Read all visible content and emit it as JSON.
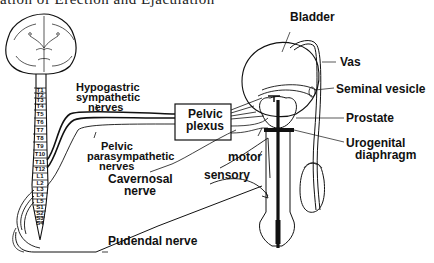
{
  "title": "ation of Erection and Ejaculation",
  "labels": {
    "bladder": "Bladder",
    "vas": "Vas",
    "seminal_vesicle": "Seminal vesicle",
    "prostate": "Prostate",
    "urogenital_1": "Urogenital",
    "urogenital_2": "diaphragm",
    "hypogastric_1": "Hypogastric",
    "hypogastric_2": "sympathetic",
    "hypogastric_3": "nerves",
    "pelvic_plexus_1": "Pelvic",
    "pelvic_plexus_2": "plexus",
    "pelvic_para_1": "Pelvic",
    "pelvic_para_2": "parasympathetic",
    "pelvic_para_3": "nerves",
    "cavernosal_1": "Cavernosal",
    "cavernosal_2": "nerve",
    "motor": "motor",
    "sensory": "sensory",
    "pudendal": "Pudendal nerve"
  },
  "spinal_segments": [
    "T1",
    "T2",
    "T3",
    "T4",
    "T5",
    "T6",
    "T7",
    "T8",
    "T9",
    "T10",
    "T11",
    "T12",
    "L1",
    "L2",
    "L3",
    "L4",
    "L5",
    "S1",
    "S2",
    "S3",
    "S4"
  ]
}
